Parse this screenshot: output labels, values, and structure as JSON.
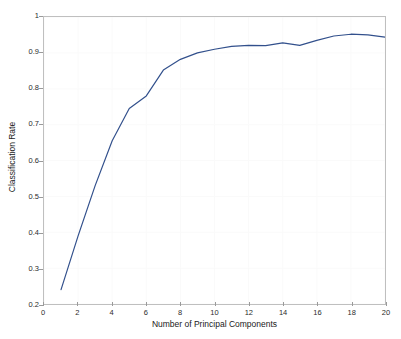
{
  "chart_data": {
    "type": "line",
    "title": "",
    "subtitle": "",
    "xlabel": "Number of Principal Components",
    "ylabel": "Classification Rate",
    "xlim": [
      0,
      20
    ],
    "ylim": [
      0.2,
      1
    ],
    "xticks": [
      0,
      2,
      4,
      6,
      8,
      10,
      12,
      14,
      16,
      18,
      20
    ],
    "xtick_labels": [
      "0",
      "2",
      "4",
      "6",
      "8",
      "10",
      "12",
      "14",
      "16",
      "18",
      "20"
    ],
    "yticks": [
      0.2,
      0.3,
      0.4,
      0.5,
      0.6,
      0.7,
      0.8,
      0.9,
      1
    ],
    "ytick_labels": [
      "0.2",
      "0.3",
      "0.4",
      "0.5",
      "0.6",
      "0.7",
      "0.8",
      "0.9",
      "1"
    ],
    "grid": true,
    "grid_color": "#fafafa",
    "legend": null,
    "legend_position": "none",
    "axes_color": "#bfbfbf",
    "background": "#ffffff",
    "series": [
      {
        "name": "Classification Rate",
        "color": "#32508c",
        "line_width": 1.2,
        "marker": "none",
        "x": [
          1,
          2,
          3,
          4,
          5,
          6,
          7,
          8,
          9,
          10,
          11,
          12,
          13,
          14,
          15,
          16,
          17,
          18,
          19,
          20
        ],
        "values": [
          0.24,
          0.39,
          0.53,
          0.655,
          0.745,
          0.78,
          0.852,
          0.882,
          0.9,
          0.91,
          0.918,
          0.921,
          0.92,
          0.928,
          0.921,
          0.935,
          0.947,
          0.952,
          0.95,
          0.944
        ]
      }
    ]
  }
}
